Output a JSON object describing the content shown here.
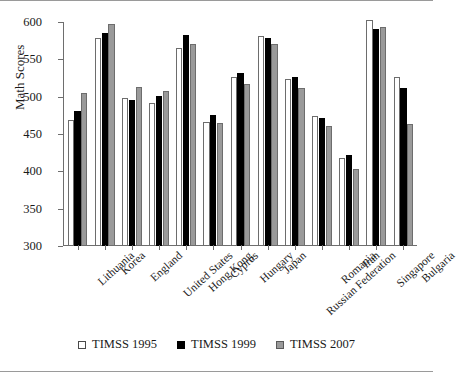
{
  "chart_data": {
    "type": "bar",
    "title": "",
    "xlabel": "",
    "ylabel": "Math Scores",
    "ylim": [
      300,
      600
    ],
    "yticks": [
      300,
      350,
      400,
      450,
      500,
      550,
      600
    ],
    "grid": false,
    "legend_position": "bottom",
    "categories": [
      "Lithuania",
      "Korea",
      "England",
      "United States",
      "Hong Kong",
      "Cyprus",
      "Hungary",
      "Japan",
      "Russian Federation",
      "Romania",
      "Iran",
      "Singapore",
      "Bulgaria"
    ],
    "series": [
      {
        "name": "TIMSS 1995",
        "color": "#ffffff",
        "values": [
          469,
          578,
          498,
          491,
          565,
          466,
          527,
          581,
          524,
          474,
          418,
          603,
          527
        ]
      },
      {
        "name": "TIMSS 1999",
        "color": "#000000",
        "values": [
          481,
          585,
          496,
          501,
          582,
          476,
          532,
          579,
          526,
          472,
          422,
          590,
          511
        ]
      },
      {
        "name": "TIMSS 2007",
        "color": "#9a9a9a",
        "values": [
          505,
          597,
          513,
          508,
          570,
          465,
          517,
          570,
          512,
          461,
          403,
          593,
          464
        ]
      }
    ]
  },
  "legend": {
    "items": [
      {
        "label": "TIMSS 1995",
        "swatch": "open-square-icon"
      },
      {
        "label": "TIMSS 1999",
        "swatch": "filled-black-square-icon"
      },
      {
        "label": "TIMSS 2007",
        "swatch": "filled-gray-square-icon"
      }
    ]
  }
}
